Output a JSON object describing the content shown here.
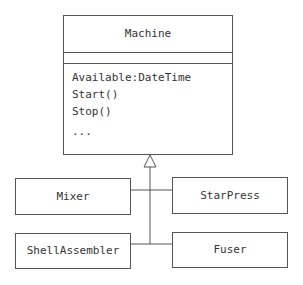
{
  "diagram": {
    "type": "uml-class-inheritance",
    "superclass": {
      "name": "Machine",
      "attributes": [],
      "operations": [
        "Available:DateTime",
        "Start()",
        "Stop()",
        "..."
      ]
    },
    "subclasses": [
      {
        "name": "Mixer"
      },
      {
        "name": "StarPress"
      },
      {
        "name": "ShellAssembler"
      },
      {
        "name": "Fuser"
      }
    ],
    "relationship": "generalization",
    "colors": {
      "line": "#555555",
      "text": "#333333",
      "background": "#ffffff"
    }
  }
}
